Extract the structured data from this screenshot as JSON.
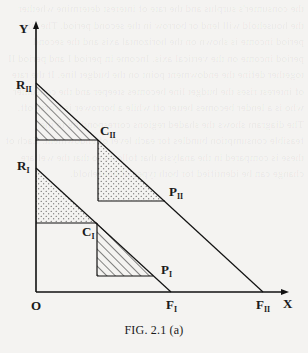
{
  "figure": {
    "caption": "FIG. 2.1 (a)",
    "axes": {
      "y_label": "Y",
      "x_label": "X",
      "origin_label": "O"
    },
    "points": {
      "R_II": {
        "main": "R",
        "sub": "II"
      },
      "C_II": {
        "main": "C",
        "sub": "II"
      },
      "P_II": {
        "main": "P",
        "sub": "II"
      },
      "F_II": {
        "main": "F",
        "sub": "II"
      },
      "R_I": {
        "main": "R",
        "sub": "I"
      },
      "C_I": {
        "main": "C",
        "sub": "I"
      },
      "P_I": {
        "main": "P",
        "sub": "I"
      },
      "F_I": {
        "main": "F",
        "sub": "I"
      }
    },
    "regions": [
      {
        "name": "upper-hatched-triangle",
        "vertices": [
          "R_II",
          "C_II",
          "axis-point"
        ],
        "fill": "diagonal-hatch"
      },
      {
        "name": "upper-dotted-triangle",
        "vertices": [
          "C_II",
          "P_II",
          "corner"
        ],
        "fill": "dots"
      },
      {
        "name": "lower-dotted-triangle",
        "vertices": [
          "R_I",
          "C_I",
          "axis-point"
        ],
        "fill": "dots"
      },
      {
        "name": "lower-hatched-triangle",
        "vertices": [
          "C_I",
          "P_I",
          "corner"
        ],
        "fill": "diagonal-hatch"
      }
    ],
    "lines": [
      {
        "name": "budget-line-II",
        "from": "R_II",
        "to": "F_II"
      },
      {
        "name": "budget-line-I",
        "from": "R_I",
        "to": "F_I"
      }
    ],
    "bleed_text": "the consumer's surplus and the rate of interest determine whether the household will lend or borrow in the second period. The first period income is shown on the horizontal axis and the second period income on the vertical axis. Income in period I and period II together define the endowment point on the budget line. If the rate of interest rises the budget line becomes steeper and the consumer who is a lender becomes better off while a borrower is worse off. The diagram shows the shaded regions corresponding to the feasible consumption bundles for each level of endowment. Each of these is compared in the analysis that follows so that the welfare change can be identified for both types of household."
  }
}
